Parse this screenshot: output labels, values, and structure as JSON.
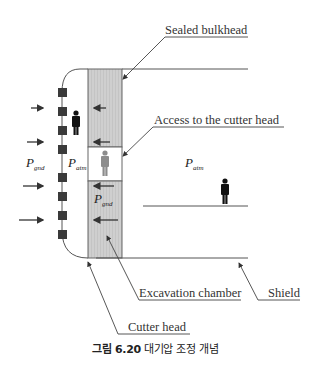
{
  "figure": {
    "caption_prefix": "그림 6.20",
    "caption_text": "대기압 조정 개념"
  },
  "labels": {
    "sealed_bulkhead": "Sealed bulkhead",
    "access_cutter_head": "Access to the cutter head",
    "excavation_chamber": "Excavation chamber",
    "shield": "Shield",
    "cutter_head": "Cutter head"
  },
  "symbols": {
    "p_gnd_outer": {
      "main": "P",
      "sub": "gnd"
    },
    "p_atm_inner": {
      "main": "P",
      "sub": "atm"
    },
    "p_atm_right": {
      "main": "P",
      "sub": "atm"
    },
    "p_gnd_chamber": {
      "main": "P",
      "sub": "gnd"
    }
  },
  "colors": {
    "chamber_fill": "#cfcfcf",
    "line": "#555555",
    "cutter_block": "#3a3a3a",
    "person_dark": "#111111",
    "person_gray": "#8c8c8c"
  }
}
